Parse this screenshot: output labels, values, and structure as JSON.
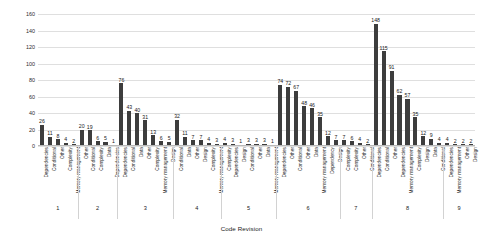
{
  "chart_data": {
    "type": "bar",
    "title": "",
    "xlabel": "Code Revision",
    "ylabel": "Number of Lines of Code",
    "ylim": [
      0,
      160
    ],
    "ytick_labels": [
      "0",
      "20",
      "40",
      "60",
      "80",
      "100",
      "120",
      "140",
      "160"
    ],
    "yticks": [
      0,
      20,
      40,
      60,
      80,
      100,
      120,
      140,
      160
    ],
    "grid": true,
    "legend": "none",
    "bar_color": "#3d3d3d",
    "groups": [
      {
        "group_label": "1",
        "categories": [
          "Dependencies",
          "Conditional",
          "Other",
          "Complexity",
          "Memory management"
        ],
        "values": [
          26,
          11,
          8,
          4,
          2
        ]
      },
      {
        "group_label": "2",
        "categories": [
          "Other",
          "Conditional",
          "Complexity",
          "Data",
          "Dependencies"
        ],
        "values": [
          20,
          19,
          6,
          5,
          1
        ]
      },
      {
        "group_label": "3",
        "categories": [
          "Dependencies",
          "Conditional",
          "Data",
          "Other",
          "Complexity",
          "Memory management",
          "Design"
        ],
        "values": [
          76,
          43,
          40,
          31,
          13,
          6,
          5
        ]
      },
      {
        "group_label": "4",
        "categories": [
          "Conditional",
          "Data",
          "Other",
          "Design",
          "Complexity",
          "Memory management"
        ],
        "values": [
          32,
          11,
          7,
          7,
          4,
          3
        ]
      },
      {
        "group_label": "5",
        "categories": [
          "Complexity",
          "Dependencies",
          "Design",
          "Conditional",
          "Other",
          "Data",
          "Memory management"
        ],
        "values": [
          4,
          3,
          1,
          3,
          3,
          3,
          1
        ]
      },
      {
        "group_label": "6",
        "categories": [
          "Dependencies",
          "Other",
          "Conditional",
          "Other",
          "Data",
          "Memory management",
          "Dependency",
          "Design"
        ],
        "values": [
          74,
          72,
          67,
          48,
          46,
          35,
          12,
          7
        ]
      },
      {
        "group_label": "7",
        "categories": [
          "Complexity",
          "Complexity",
          "Other",
          "Conditional"
        ],
        "values": [
          7,
          6,
          4,
          2
        ]
      },
      {
        "group_label": "8",
        "categories": [
          "Dependencies",
          "Conditional",
          "Other",
          "Dependencies",
          "Memory management",
          "Complexity",
          "Design",
          "Data",
          "Conditional"
        ],
        "values": [
          148,
          115,
          91,
          62,
          57,
          35,
          12,
          9,
          4
        ]
      },
      {
        "group_label": "9",
        "categories": [
          "Dependencies",
          "Memory management",
          "Other",
          "Design"
        ],
        "values": [
          4,
          2,
          2,
          2
        ]
      }
    ]
  }
}
